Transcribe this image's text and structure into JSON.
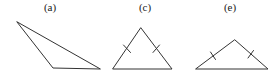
{
  "figure": {
    "background_color": "#ffffff",
    "stroke_color": "#333333",
    "stroke_width": 1,
    "width": 275,
    "height": 77
  },
  "panels": [
    {
      "id": "a",
      "label": "(a)",
      "label_x": 50,
      "label_y": 8,
      "shape": "triangle",
      "description": "obtuse scalene triangle, no congruence tick marks",
      "points": "17,22 53,68 100,69",
      "vertices": [
        {
          "x": 17,
          "y": 22
        },
        {
          "x": 53,
          "y": 68
        },
        {
          "x": 100,
          "y": 69
        }
      ],
      "tick_marks": []
    },
    {
      "id": "c",
      "label": "(c)",
      "label_x": 145,
      "label_y": 8,
      "shape": "triangle",
      "description": "isosceles triangle with one tick mark on each of the two equal slanted sides",
      "points": "141,28 172,69 113,69",
      "vertices": [
        {
          "x": 141,
          "y": 28
        },
        {
          "x": 172,
          "y": 69
        },
        {
          "x": 113,
          "y": 69
        }
      ],
      "tick_marks": [
        {
          "x1": 123.5,
          "y1": 45.0,
          "x2": 130.5,
          "y2": 52.5
        },
        {
          "x1": 153.0,
          "y1": 52.5,
          "x2": 159.5,
          "y2": 45.0
        }
      ]
    },
    {
      "id": "e",
      "label": "(e)",
      "label_x": 230,
      "label_y": 8,
      "shape": "triangle",
      "description": "flatter isosceles triangle with one tick mark on each of the two equal slanted sides",
      "points": "235,40 268,69 196,69",
      "vertices": [
        {
          "x": 235,
          "y": 40
        },
        {
          "x": 268,
          "y": 69
        },
        {
          "x": 196,
          "y": 69
        }
      ],
      "tick_marks": [
        {
          "x1": 210.5,
          "y1": 52.0,
          "x2": 215.5,
          "y2": 59.5
        },
        {
          "x1": 248.0,
          "y1": 58.0,
          "x2": 253.5,
          "y2": 50.5
        }
      ]
    }
  ]
}
